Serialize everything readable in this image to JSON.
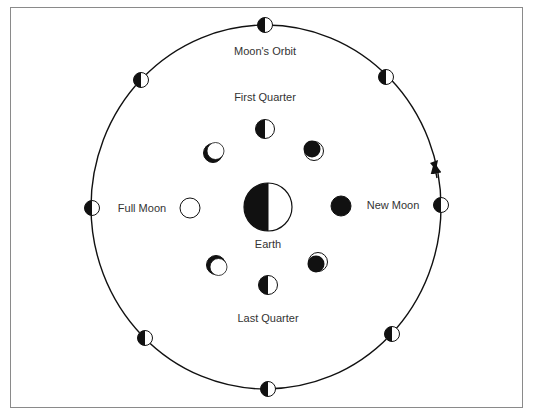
{
  "diagram": {
    "labels": {
      "orbit": "Moon's Orbit",
      "first_quarter": "First Quarter",
      "last_quarter": "Last Quarter",
      "full_moon": "Full Moon",
      "new_moon": "New Moon",
      "earth": "Earth"
    },
    "colors": {
      "ink": "#111111",
      "text": "#333333",
      "paper": "#ffffff",
      "frame": "#8a8a8a"
    },
    "orbit": {
      "cx": 266,
      "cy": 207,
      "rx": 175,
      "ry": 182,
      "direction": "counterclockwise"
    },
    "earth": {
      "cx": 268,
      "cy": 207,
      "r": 24,
      "dark_side": "left",
      "lit_side": "right"
    },
    "orbit_moons": [
      {
        "name": "orbit-moon-top",
        "cx": 265,
        "cy": 25
      },
      {
        "name": "orbit-moon-upper-right",
        "cx": 386,
        "cy": 77
      },
      {
        "name": "orbit-moon-right",
        "cx": 441,
        "cy": 205
      },
      {
        "name": "orbit-moon-lower-right",
        "cx": 392,
        "cy": 334
      },
      {
        "name": "orbit-moon-bottom",
        "cx": 268,
        "cy": 389
      },
      {
        "name": "orbit-moon-lower-left",
        "cx": 145,
        "cy": 338
      },
      {
        "name": "orbit-moon-left",
        "cx": 92,
        "cy": 208
      },
      {
        "name": "orbit-moon-upper-left",
        "cx": 141,
        "cy": 80
      }
    ],
    "phase_moons": [
      {
        "name": "phase-new-moon",
        "phase": "New Moon",
        "cx": 341,
        "cy": 206
      },
      {
        "name": "phase-waxing-crescent",
        "phase": "Waxing Crescent",
        "cx": 314,
        "cy": 151
      },
      {
        "name": "phase-first-quarter",
        "phase": "First Quarter",
        "cx": 265,
        "cy": 129
      },
      {
        "name": "phase-waxing-gibbous",
        "phase": "Waxing Gibbous",
        "cx": 213,
        "cy": 153
      },
      {
        "name": "phase-full-moon",
        "phase": "Full Moon",
        "cx": 190,
        "cy": 208
      },
      {
        "name": "phase-waning-gibbous",
        "phase": "Waning Gibbous",
        "cx": 216,
        "cy": 265
      },
      {
        "name": "phase-last-quarter",
        "phase": "Last Quarter",
        "cx": 268,
        "cy": 285
      },
      {
        "name": "phase-waning-crescent",
        "phase": "Waning Crescent",
        "cx": 318,
        "cy": 262
      }
    ]
  }
}
